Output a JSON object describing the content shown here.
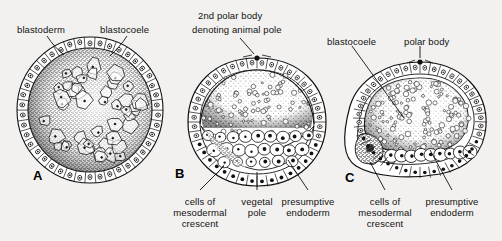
{
  "figure": {
    "background_color": "#f2f1ef",
    "ink_color": "#111111",
    "panels": [
      {
        "letter": "A",
        "letter_x": 33,
        "letter_y": 168,
        "labels": [
          {
            "text": "blastoderm",
            "x": 17,
            "y": 24,
            "align": "left"
          },
          {
            "text": "blastocoele",
            "x": 100,
            "y": 24,
            "align": "left"
          }
        ]
      },
      {
        "letter": "B",
        "letter_x": 175,
        "letter_y": 166,
        "labels": [
          {
            "text": "2nd polar body",
            "x": 198,
            "y": 10,
            "align": "left"
          },
          {
            "text": "denoting animal pole",
            "x": 192,
            "y": 24,
            "align": "left"
          },
          {
            "text": "cells of",
            "x": 200,
            "y": 196,
            "align": "center"
          },
          {
            "text": "mesodermal",
            "x": 200,
            "y": 207,
            "align": "center"
          },
          {
            "text": "crescent",
            "x": 200,
            "y": 218,
            "align": "center"
          },
          {
            "text": "vegetal",
            "x": 257,
            "y": 196,
            "align": "center"
          },
          {
            "text": "pole",
            "x": 257,
            "y": 207,
            "align": "center"
          },
          {
            "text": "presumptive",
            "x": 308,
            "y": 196,
            "align": "center"
          },
          {
            "text": "endoderm",
            "x": 308,
            "y": 207,
            "align": "center"
          }
        ]
      },
      {
        "letter": "C",
        "letter_x": 345,
        "letter_y": 170,
        "labels": [
          {
            "text": "blastocoele",
            "x": 327,
            "y": 36,
            "align": "left"
          },
          {
            "text": "polar body",
            "x": 404,
            "y": 36,
            "align": "left"
          },
          {
            "text": "cells of",
            "x": 385,
            "y": 196,
            "align": "center"
          },
          {
            "text": "mesodermal",
            "x": 385,
            "y": 207,
            "align": "center"
          },
          {
            "text": "crescent",
            "x": 385,
            "y": 218,
            "align": "center"
          },
          {
            "text": "presumptive",
            "x": 452,
            "y": 196,
            "align": "center"
          },
          {
            "text": "endoderm",
            "x": 452,
            "y": 207,
            "align": "center"
          }
        ]
      }
    ],
    "structures": {
      "blastoderm": "outer ring of columnar cells with nuclei",
      "blastocoele": "internal fluid-filled cavity",
      "yolk_mass": "stippled interior with large polygonal yolk cells",
      "polar_body": "small dark dot at animal pole",
      "mesodermal_crescent": "dark pigmented patch at lower side",
      "presumptive_endoderm": "large pale cells with dark nuclei at vegetal side"
    }
  }
}
